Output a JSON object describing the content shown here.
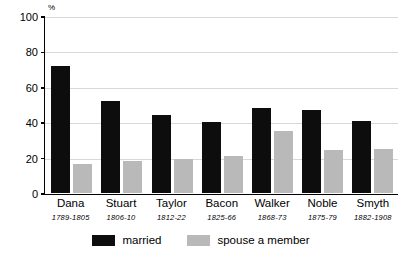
{
  "chart_data": {
    "type": "bar",
    "title": "",
    "xlabel": "",
    "ylabel": "%",
    "unit_label": "%",
    "ylim": [
      0,
      100
    ],
    "y_ticks": [
      0,
      20,
      40,
      60,
      80,
      100
    ],
    "grid": true,
    "legend_position": "bottom",
    "categories": [
      "Dana",
      "Stuart",
      "Taylor",
      "Bacon",
      "Walker",
      "Noble",
      "Smyth"
    ],
    "category_years": [
      "1789-1805",
      "1806-10",
      "1812-22",
      "1825-66",
      "1868-73",
      "1875-79",
      "1882-1908"
    ],
    "series": [
      {
        "name": "married",
        "color": "#0d0d0d",
        "values": [
          72,
          52,
          44,
          40,
          48,
          47,
          41
        ]
      },
      {
        "name": "spouse a member",
        "color": "#b9b9b9",
        "values": [
          16,
          18,
          19,
          21,
          35,
          24,
          25
        ]
      }
    ]
  },
  "legend": {
    "items": [
      {
        "label": "married"
      },
      {
        "label": "spouse a member"
      }
    ]
  }
}
